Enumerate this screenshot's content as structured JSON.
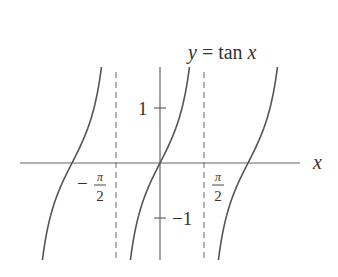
{
  "title": "y = tan x",
  "labels": {
    "function": "y = tan x",
    "x_axis": "x",
    "y_tick_pos": "1",
    "y_tick_neg": "−1",
    "x_tick_neg_sign": "−",
    "x_tick_num": "π",
    "x_tick_den": "2"
  },
  "colors": {
    "curve": "#555555",
    "axis": "#666666",
    "asymptote": "#777777",
    "text": "#333333"
  },
  "chart_data": {
    "type": "line",
    "title": "y = tan x",
    "xlabel": "x",
    "ylabel": "y",
    "function": "tan(x)",
    "x_ticks": [
      "-π/2",
      "π/2"
    ],
    "y_ticks": [
      1,
      -1
    ],
    "asymptotes": [
      "x = -π/2",
      "x = π/2"
    ],
    "ylim": [
      -1.76,
      1.75
    ],
    "xlim": [
      -2.5,
      2.5
    ],
    "branches": [
      {
        "name": "left branch",
        "interval": "(-3π/2, -π/2)",
        "zero": "-π"
      },
      {
        "name": "center branch",
        "interval": "(-π/2, π/2)",
        "zero": "0"
      },
      {
        "name": "right branch",
        "interval": "(π/2, 3π/2)",
        "zero": "π"
      }
    ],
    "grid": false
  }
}
